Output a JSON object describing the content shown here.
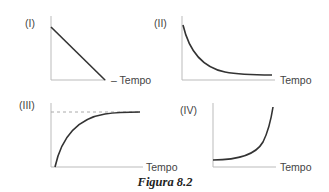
{
  "figure": {
    "caption": "Figura 8.2",
    "panels": [
      {
        "id": "I",
        "label": "(I)",
        "x_axis_label": "– Tempo",
        "curve": "linear decrease"
      },
      {
        "id": "II",
        "label": "(II)",
        "x_axis_label": "Tempo",
        "curve": "exponential decay to asymptote"
      },
      {
        "id": "III",
        "label": "(III)",
        "x_axis_label": "Tempo",
        "curve": "rise to asymptote (dashed line)"
      },
      {
        "id": "IV",
        "label": "(IV)",
        "x_axis_label": "Tempo",
        "curve": "exponential growth"
      }
    ]
  },
  "colors": {
    "axis": "#bbbbbb",
    "curve": "#333333",
    "dashed": "#aaaaaa"
  }
}
